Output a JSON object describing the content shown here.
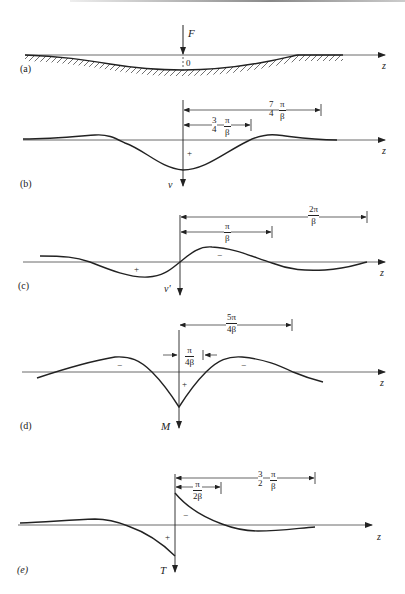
{
  "figure": {
    "type": "beam on elastic foundation response diagrams",
    "axis_label": "z",
    "panels": [
      {
        "id": "a",
        "label": "(a)",
        "force_label": "F",
        "origin_label": "0",
        "description": "Beam deflected under point load F on elastic foundation (hatched)"
      },
      {
        "id": "b",
        "label": "(b)",
        "quantity": "ν",
        "sign": "+",
        "dimensions": [
          {
            "coef_num": "3",
            "coef_den": "4",
            "num": "π",
            "den": "β"
          },
          {
            "coef_num": "7",
            "coef_den": "4",
            "num": "π",
            "den": "β"
          }
        ]
      },
      {
        "id": "c",
        "label": "(c)",
        "quantity": "ν'",
        "signs": [
          "+",
          "−"
        ],
        "dimensions": [
          {
            "num": "π",
            "den": "β"
          },
          {
            "num": "2π",
            "den": "β"
          }
        ]
      },
      {
        "id": "d",
        "label": "(d)",
        "quantity": "M",
        "signs": [
          "−",
          "+",
          "−"
        ],
        "dimensions": [
          {
            "num": "π",
            "den": "4β"
          },
          {
            "num": "5π",
            "den": "4β"
          }
        ]
      },
      {
        "id": "e",
        "label": "(e)",
        "quantity": "T",
        "signs": [
          "+",
          "−"
        ],
        "dimensions": [
          {
            "num": "π",
            "den": "2β"
          },
          {
            "coef_num": "3",
            "coef_den": "2",
            "num": "π",
            "den": "β"
          }
        ]
      }
    ]
  },
  "colors": {
    "line": "#222222",
    "background": "#ffffff"
  }
}
